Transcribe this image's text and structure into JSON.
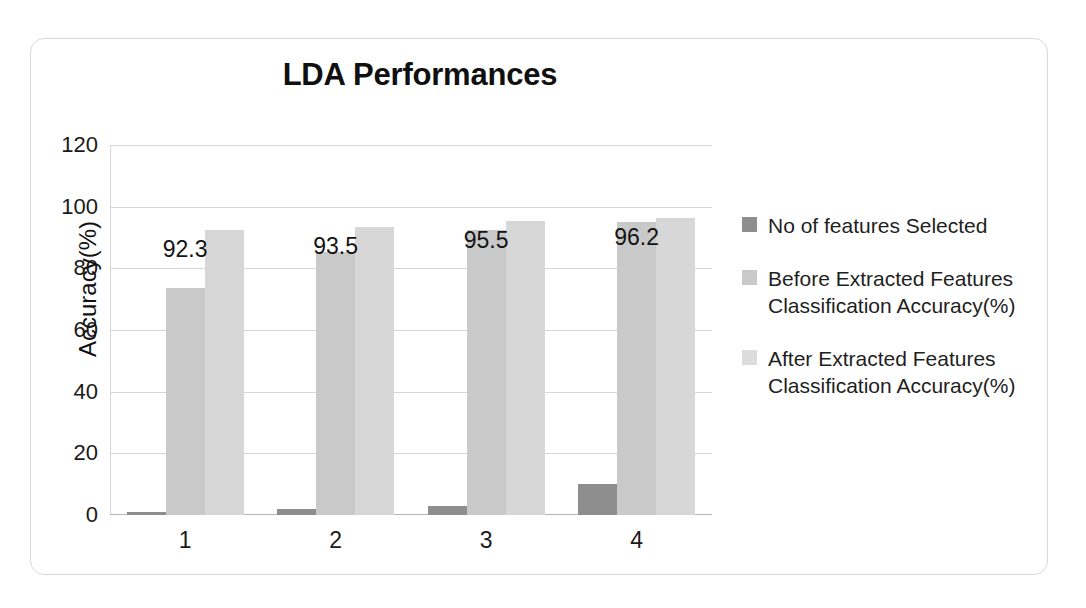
{
  "chart_data": {
    "type": "bar",
    "title": "LDA Performances",
    "xlabel": "",
    "ylabel": "Accuracy(%)",
    "categories": [
      "1",
      "2",
      "3",
      "4"
    ],
    "ylim": [
      0,
      120
    ],
    "yticks": [
      "0",
      "20",
      "40",
      "60",
      "80",
      "100",
      "120"
    ],
    "grid": true,
    "legend_position": "right",
    "series": [
      {
        "name": "No of features Selected",
        "color": "#8e8e8e",
        "values": [
          1,
          2,
          3,
          10
        ],
        "labels": [
          "",
          "",
          "",
          ""
        ]
      },
      {
        "name": "Before Extracted Features Classification Accuracy(%)",
        "color": "#c9c9c9",
        "values": [
          73.5,
          85.2,
          92.3,
          95.0
        ],
        "labels": [
          "",
          "",
          "",
          ""
        ]
      },
      {
        "name": "After Extracted Features Classification Accuracy(%)",
        "color": "#d7d7d7",
        "values": [
          92.3,
          93.5,
          95.5,
          96.2
        ],
        "labels": [
          "92.3",
          "93.5",
          "95.5",
          "96.2"
        ]
      }
    ]
  },
  "legend": {
    "items": [
      {
        "label": "No of features Selected"
      },
      {
        "label": "Before Extracted Features Classification Accuracy(%)"
      },
      {
        "label": "After Extracted Features Classification Accuracy(%)"
      }
    ]
  }
}
